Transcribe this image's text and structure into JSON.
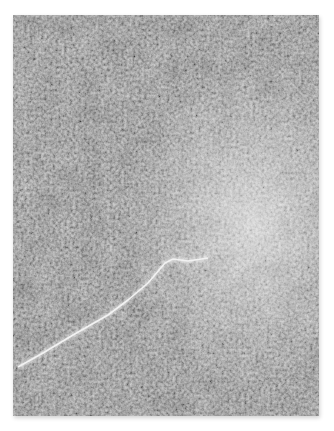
{
  "image": {
    "description": "Grayscale microscopy-style texture photograph with a thin bright crack running diagonally from lower-left toward center, and a diffuse bright glow on the right side",
    "colors": {
      "base": "#7c7c7c",
      "dark": "#5a5a5a",
      "light": "#bdbdbd",
      "glow": "#e6e6e6",
      "crack": "#f4f4f4",
      "background": "#ffffff"
    }
  }
}
